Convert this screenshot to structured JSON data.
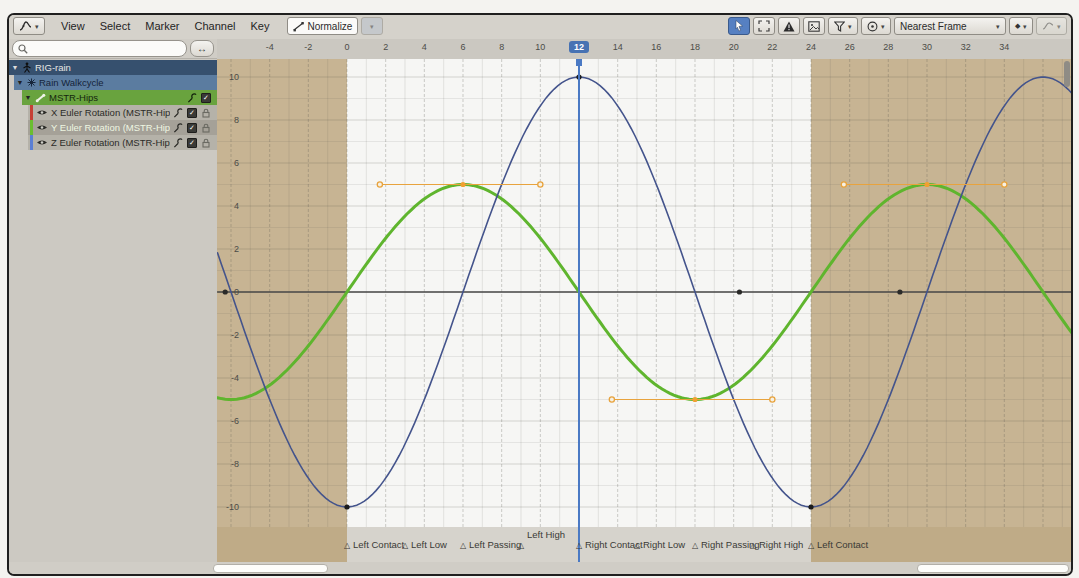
{
  "header": {
    "menus": [
      "View",
      "Select",
      "Marker",
      "Channel",
      "Key"
    ],
    "normalize_label": "Normalize",
    "snap_label": "Nearest Frame"
  },
  "sidebar": {
    "rows": [
      {
        "label": "RIG-rain",
        "icon": "armature-icon"
      },
      {
        "label": "Rain Walkcycle",
        "icon": "action-icon"
      },
      {
        "label": "MSTR-Hips",
        "icon": "bone-icon"
      },
      {
        "label": "X Euler Rotation (MSTR-Hips)",
        "icon": "eye-icon",
        "tag_color": "#c64035",
        "selected": false
      },
      {
        "label": "Y Euler Rotation (MSTR-Hips)",
        "icon": "eye-icon",
        "tag_color": "#6abe30",
        "selected": true
      },
      {
        "label": "Z Euler Rotation (MSTR-Hips)",
        "icon": "eye-icon",
        "tag_color": "#5b7fd4",
        "selected": false
      }
    ]
  },
  "ruler": {
    "ticks": [
      -4,
      -2,
      0,
      2,
      4,
      6,
      8,
      10,
      12,
      14,
      16,
      18,
      20,
      22,
      24,
      26,
      28,
      30,
      32,
      34
    ],
    "current_frame": 12
  },
  "chart_data": {
    "type": "line",
    "x_axis": "frame",
    "y_ticks": [
      10,
      8,
      6,
      4,
      2,
      0,
      -2,
      -4,
      -6,
      -8,
      -10
    ],
    "x_visible_range": [
      -6.7,
      37.5
    ],
    "y_visible_range": [
      -11.5,
      10.8
    ],
    "frame_range": {
      "start": 0,
      "end": 24
    },
    "current_frame": 12,
    "series": [
      {
        "name": "Y Euler Rotation (MSTR-Hips)",
        "color": "#5fb52e",
        "width": 3,
        "fn": "sin",
        "scale": 5,
        "period": 24,
        "keyframes": [
          [
            6,
            5
          ],
          [
            18,
            -5
          ],
          [
            30,
            5
          ]
        ],
        "key_color": "#f0a030"
      },
      {
        "name": "Z Euler Rotation (MSTR-Hips)",
        "color": "#44548c",
        "width": 1.6,
        "fn": "cos",
        "scale": -10,
        "period": 24,
        "keyframes": [
          [
            0,
            -10
          ],
          [
            12,
            10
          ],
          [
            24,
            -10
          ]
        ],
        "key_color": "#1c1c1c"
      },
      {
        "name": "X Euler Rotation (MSTR-Hips)",
        "color": "#4a4a48",
        "width": 1.5,
        "fn": "const",
        "value": 0,
        "keyframes": [
          [
            -6.3,
            0
          ],
          [
            20.3,
            0
          ],
          [
            28.6,
            0
          ]
        ],
        "key_color": "#2a2a28"
      }
    ],
    "handles": [
      {
        "key": [
          6,
          5
        ],
        "left": [
          1.7,
          5
        ],
        "right": [
          10,
          5
        ]
      },
      {
        "key": [
          18,
          -5
        ],
        "left": [
          13.7,
          -5
        ],
        "right": [
          22,
          -5
        ]
      },
      {
        "key": [
          30,
          5
        ],
        "left": [
          25.7,
          5
        ],
        "right": [
          34,
          5
        ]
      }
    ]
  },
  "markers": [
    {
      "frame": 0,
      "label": "Left Contact",
      "raised": false
    },
    {
      "frame": 3,
      "label": "Left Low",
      "raised": false
    },
    {
      "frame": 6,
      "label": "Left Passing",
      "raised": false
    },
    {
      "frame": 9,
      "label": "Left High",
      "raised": true
    },
    {
      "frame": 12,
      "label": "Right Contact",
      "raised": false
    },
    {
      "frame": 15,
      "label": "Right Low",
      "raised": false
    },
    {
      "frame": 18,
      "label": "Right Passing",
      "raised": false
    },
    {
      "frame": 21,
      "label": "Right High",
      "raised": false
    },
    {
      "frame": 24,
      "label": "Left Contact",
      "raised": false
    }
  ],
  "colors": {
    "accent_blue": "#4772b3",
    "playhead": "#4a79c4",
    "in_range_bg": "#f6f6f4",
    "out_of_range": "#c7b493",
    "marker_band": "#d6d3cc",
    "handle_orange": "#e8a33d",
    "zero_line": "#4e4e4c"
  }
}
